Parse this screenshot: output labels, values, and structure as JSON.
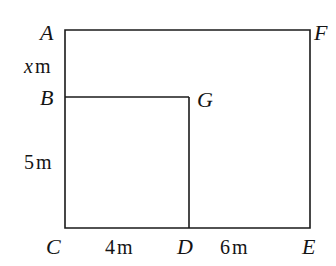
{
  "figure": {
    "type": "geometry-diagram",
    "stroke_color": "#1a1a1a",
    "background_color": "#ffffff",
    "stroke_width": 1.6
  },
  "vertices": {
    "A": "A",
    "B": "B",
    "C": "C",
    "D": "D",
    "E": "E",
    "F": "F",
    "G": "G"
  },
  "measurements": {
    "ab": {
      "value": "x",
      "unit": "m",
      "full": "x m",
      "side": "AB (left edge, upper segment)"
    },
    "bc": {
      "value": "5",
      "unit": "m",
      "full": "5 m",
      "side": "BC (left edge, lower segment)"
    },
    "cd": {
      "value": "4",
      "unit": "m",
      "full": "4 m",
      "side": "CD (bottom edge, left segment)"
    },
    "de": {
      "value": "6",
      "unit": "m",
      "full": "6 m",
      "side": "DE (bottom edge, right segment)"
    }
  },
  "geometry": {
    "outer_rect": {
      "x1": 65,
      "y1": 30,
      "x2": 310,
      "y2": 228
    },
    "inner_vertical_x": 189,
    "inner_horizontal_y": 97
  }
}
